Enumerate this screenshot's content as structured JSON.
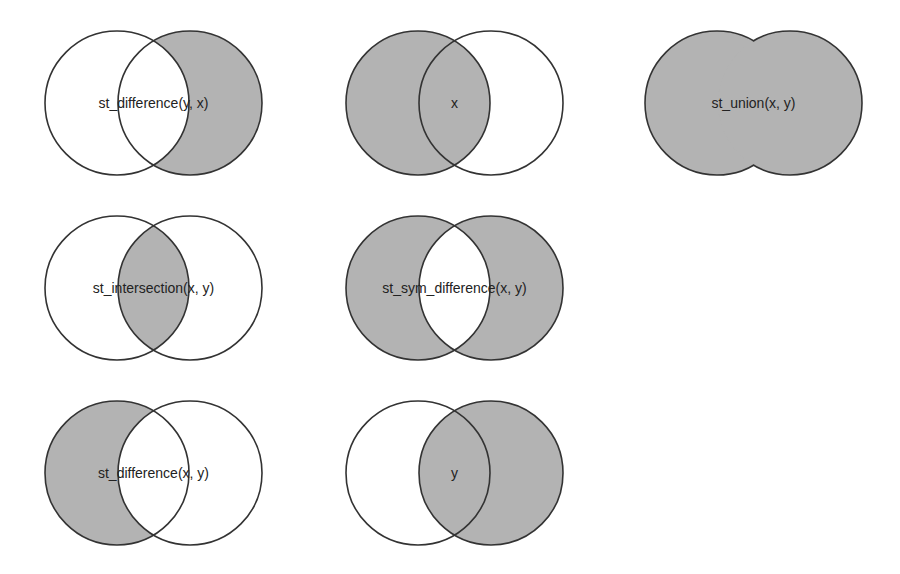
{
  "colors": {
    "fill": "#b3b3b3",
    "stroke": "#333333",
    "background": "#ffffff",
    "text": "#222222"
  },
  "geometry": {
    "radius": 72,
    "offset": 73
  },
  "panels": [
    {
      "id": "st-difference-y-x",
      "label": "st_difference(y, x)",
      "cx": 117,
      "cy": 103,
      "region": "y_only"
    },
    {
      "id": "x",
      "label": "x",
      "cx": 418,
      "cy": 103,
      "region": "x"
    },
    {
      "id": "st-union-x-y",
      "label": "st_union(x, y)",
      "cx": 717,
      "cy": 103,
      "region": "union"
    },
    {
      "id": "st-intersection-x-y",
      "label": "st_intersection(x, y)",
      "cx": 117,
      "cy": 288,
      "region": "intersection"
    },
    {
      "id": "st-sym-difference-x-y",
      "label": "st_sym_difference(x, y)",
      "cx": 418,
      "cy": 288,
      "region": "sym_difference"
    },
    {
      "id": "st-difference-x-y",
      "label": "st_difference(x, y)",
      "cx": 117,
      "cy": 473,
      "region": "x_only"
    },
    {
      "id": "y",
      "label": "y",
      "cx": 418,
      "cy": 473,
      "region": "y"
    }
  ]
}
